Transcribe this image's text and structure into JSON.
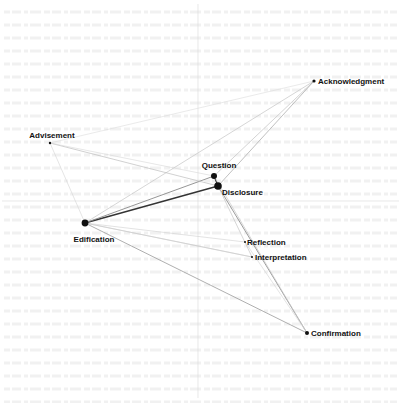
{
  "diagram": {
    "type": "network-map",
    "axes": {
      "vertical_x": 198,
      "horizontal_y": 201,
      "color": "#d8d8d8"
    },
    "node_color": "#111111",
    "nodes": [
      {
        "id": "acknowledgment",
        "label": "Acknowledgment",
        "x": 314,
        "y": 81,
        "r": 1.6,
        "label_x": 318,
        "label_y": 84,
        "anchor": "start"
      },
      {
        "id": "advisement",
        "label": "Advisement",
        "x": 50,
        "y": 143,
        "r": 1.2,
        "label_x": 52,
        "label_y": 138,
        "anchor": "middle"
      },
      {
        "id": "question",
        "label": "Question",
        "x": 214,
        "y": 176,
        "r": 3.0,
        "label_x": 219,
        "label_y": 168,
        "anchor": "middle"
      },
      {
        "id": "disclosure",
        "label": "Disclosure",
        "x": 218,
        "y": 186,
        "r": 3.8,
        "label_x": 222,
        "label_y": 195,
        "anchor": "start"
      },
      {
        "id": "edification",
        "label": "Edification",
        "x": 85,
        "y": 223,
        "r": 3.4,
        "label_x": 94,
        "label_y": 242,
        "anchor": "middle"
      },
      {
        "id": "reflection",
        "label": "Reflection",
        "x": 245,
        "y": 242,
        "r": 1.0,
        "label_x": 247,
        "label_y": 245,
        "anchor": "start"
      },
      {
        "id": "interpretation",
        "label": "Interpretation",
        "x": 252,
        "y": 257,
        "r": 1.0,
        "label_x": 255,
        "label_y": 260,
        "anchor": "start"
      },
      {
        "id": "confirmation",
        "label": "Confirmation",
        "x": 307,
        "y": 333,
        "r": 2.0,
        "label_x": 311,
        "label_y": 336,
        "anchor": "start"
      }
    ],
    "edges": [
      {
        "from": "edification",
        "to": "disclosure",
        "color": "#333333",
        "width": 1.3
      },
      {
        "from": "edification",
        "to": "question",
        "color": "#8a8a8a",
        "width": 0.9
      },
      {
        "from": "edification",
        "to": "acknowledgment",
        "color": "#c4c4c4",
        "width": 0.7
      },
      {
        "from": "edification",
        "to": "confirmation",
        "color": "#9a9a9a",
        "width": 0.8
      },
      {
        "from": "edification",
        "to": "interpretation",
        "color": "#c8c8c8",
        "width": 0.7
      },
      {
        "from": "edification",
        "to": "reflection",
        "color": "#d0d0d0",
        "width": 0.6
      },
      {
        "from": "edification",
        "to": "advisement",
        "color": "#d4d4d4",
        "width": 0.6
      },
      {
        "from": "advisement",
        "to": "disclosure",
        "color": "#bdbdbd",
        "width": 0.7
      },
      {
        "from": "advisement",
        "to": "question",
        "color": "#d6d6d6",
        "width": 0.6
      },
      {
        "from": "advisement",
        "to": "acknowledgment",
        "color": "#dcdcdc",
        "width": 0.6
      },
      {
        "from": "question",
        "to": "disclosure",
        "color": "#333333",
        "width": 1.2
      },
      {
        "from": "question",
        "to": "acknowledgment",
        "color": "#c2c2c2",
        "width": 0.7
      },
      {
        "from": "disclosure",
        "to": "acknowledgment",
        "color": "#b0b0b0",
        "width": 0.8
      },
      {
        "from": "disclosure",
        "to": "confirmation",
        "color": "#909090",
        "width": 0.9
      },
      {
        "from": "disclosure",
        "to": "interpretation",
        "color": "#c4c4c4",
        "width": 0.7
      },
      {
        "from": "question",
        "to": "confirmation",
        "color": "#c8c8c8",
        "width": 0.7
      },
      {
        "from": "reflection",
        "to": "confirmation",
        "color": "#d2d2d2",
        "width": 0.6
      },
      {
        "from": "interpretation",
        "to": "edification",
        "color": "#cfcfcf",
        "width": 0.6
      }
    ]
  }
}
